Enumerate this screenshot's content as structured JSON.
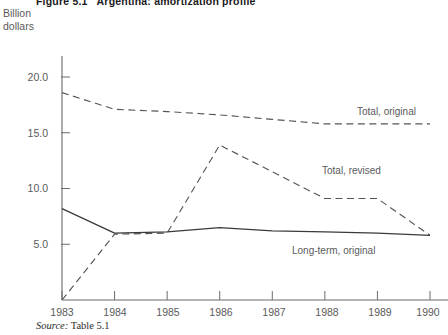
{
  "figure": {
    "title": "Figure 5.1   Argentina: amortization profile",
    "unit_label": "Billion\ndollars",
    "source_prefix": "Source:",
    "source_value": " Table 5.1"
  },
  "labels": {
    "total_original": "Total, original",
    "total_revised": "Total, revised",
    "long_term_original": "Long-term, original"
  },
  "chart_data": {
    "type": "line",
    "title": "Figure 5.1   Argentina: amortization profile",
    "xlabel": "",
    "ylabel": "Billion dollars",
    "x": [
      1983,
      1984,
      1985,
      1986,
      1987,
      1988,
      1989,
      1990
    ],
    "categories": [
      "1983",
      "1984",
      "1985",
      "1986",
      "1987",
      "1988",
      "1989",
      "1990"
    ],
    "xlim": [
      1983,
      1990
    ],
    "ylim": [
      0,
      21.5
    ],
    "yticks": [
      5.0,
      10.0,
      15.0,
      20.0
    ],
    "ytick_labels": [
      "5.0",
      "10.0",
      "15.0",
      "20.0"
    ],
    "grid": false,
    "legend": "inline-annotations",
    "series": [
      {
        "name": "Total, original",
        "style": "dashed",
        "color": "#555555",
        "values": [
          18.6,
          17.1,
          16.9,
          16.6,
          16.2,
          15.8,
          15.8,
          15.8
        ]
      },
      {
        "name": "Total, revised",
        "style": "dashed",
        "color": "#555555",
        "values": [
          0.0,
          5.9,
          6.0,
          13.9,
          11.5,
          9.1,
          9.1,
          5.8
        ]
      },
      {
        "name": "Long-term, original",
        "style": "solid",
        "color": "#3a3a3a",
        "values": [
          8.2,
          6.0,
          6.1,
          6.5,
          6.2,
          6.1,
          6.0,
          5.8
        ]
      }
    ],
    "annotations": [
      {
        "text": "Total, original",
        "x": 1988.1,
        "y": 17.2
      },
      {
        "text": "Total, revised",
        "x": 1987.2,
        "y": 11.3
      },
      {
        "text": "Long-term, original",
        "x": 1986.6,
        "y": 4.4
      }
    ]
  }
}
